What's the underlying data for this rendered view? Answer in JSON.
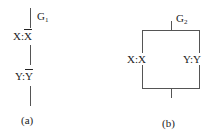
{
  "diagram_a": {
    "gate_label": "G",
    "gate_sub": "1",
    "node1_var": "X:",
    "node1_val": "X",
    "node1_overline": true,
    "node2_var": "Y:",
    "node2_val": "Y",
    "node2_overline": true,
    "caption": "(a)"
  },
  "diagram_b": {
    "gate_label": "G",
    "gate_sub": "2",
    "left_branch_var": "X:",
    "left_branch_val": "X",
    "right_branch_var": "Y:",
    "right_branch_val": "Y",
    "caption": "(b)"
  }
}
